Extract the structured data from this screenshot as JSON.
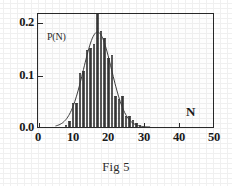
{
  "figure": {
    "caption": "Fig 5",
    "xlabel": "N",
    "ylabel": "P(N)"
  },
  "chart_data": {
    "type": "bar",
    "title": "",
    "subtitle": "",
    "caption": "Fig 5",
    "xlabel": "N",
    "ylabel": "P(N)",
    "xlim": [
      0,
      50
    ],
    "ylim": [
      0.0,
      0.22
    ],
    "grid": false,
    "legend": null,
    "xticks": [
      0,
      10,
      20,
      30,
      40,
      50
    ],
    "xtick_labels": [
      "0",
      "10",
      "20",
      "30",
      "40",
      "50"
    ],
    "yticks": [
      0.0,
      0.1,
      0.2
    ],
    "ytick_labels": [
      "0.0",
      "0.1",
      "0.2"
    ],
    "bar_width": 1,
    "x": [
      8,
      9,
      10,
      11,
      12,
      13,
      14,
      15,
      16,
      17,
      18,
      19,
      20,
      21,
      22,
      23,
      24,
      25,
      26,
      27,
      28,
      29
    ],
    "values": [
      0.004,
      0.012,
      0.046,
      0.046,
      0.104,
      0.108,
      0.148,
      0.152,
      0.158,
      0.222,
      0.183,
      0.171,
      0.132,
      0.138,
      0.06,
      0.053,
      0.06,
      0.022,
      0.021,
      0.014,
      0.007,
      0.003
    ],
    "series": [
      {
        "name": "P(N) histogram",
        "type": "bar",
        "values": [
          0.004,
          0.012,
          0.046,
          0.046,
          0.104,
          0.108,
          0.148,
          0.152,
          0.158,
          0.222,
          0.183,
          0.171,
          0.132,
          0.138,
          0.06,
          0.053,
          0.06,
          0.022,
          0.021,
          0.014,
          0.007,
          0.003
        ]
      },
      {
        "name": "Gaussian fit",
        "type": "line",
        "peak_x": 17,
        "peak_y": 0.185,
        "sigma": 4.0,
        "x_start": 5,
        "x_end": 32
      }
    ],
    "annotations": [
      {
        "text": "P(N)",
        "x": 3.0,
        "y": 0.183,
        "role": "y-axis-label-inside-plot"
      },
      {
        "text": "N",
        "x": 44.0,
        "y": 0.032,
        "role": "x-axis-label-inside-plot"
      }
    ],
    "colors": {
      "bar_fill": "#8c8c8c",
      "bar_hatch": "#282828",
      "curve": "#3a3a3a",
      "axis": "#2b2b2b",
      "text": "#1a1a1a",
      "background": "#ffffff"
    }
  }
}
